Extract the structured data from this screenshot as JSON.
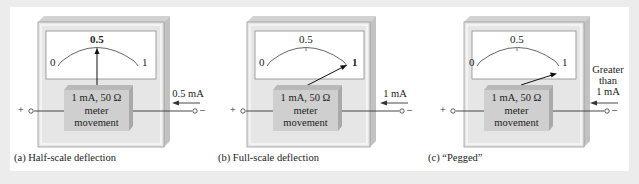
{
  "figures": [
    {
      "id": "a",
      "caption": "(a) Half-scale deflection",
      "scale": {
        "min_label": "0",
        "mid_label": "0.5",
        "max_label": "1",
        "mid_bold": true,
        "max_bold": false
      },
      "movement": {
        "line1": "1 mA, 50 Ω",
        "line2": "meter",
        "line3": "movement"
      },
      "terminals": {
        "plus": "+",
        "minus": "–"
      },
      "current_label": [
        "0.5 mA"
      ],
      "needle_position": "half-scale"
    },
    {
      "id": "b",
      "caption": "(b) Full-scale deflection",
      "scale": {
        "min_label": "0",
        "mid_label": "0.5",
        "max_label": "1",
        "mid_bold": false,
        "max_bold": true
      },
      "movement": {
        "line1": "1 mA, 50 Ω",
        "line2": "meter",
        "line3": "movement"
      },
      "terminals": {
        "plus": "+",
        "minus": "–"
      },
      "current_label": [
        "1 mA"
      ],
      "needle_position": "full-scale"
    },
    {
      "id": "c",
      "caption": "(c) “Pegged”",
      "scale": {
        "min_label": "0",
        "mid_label": "0.5",
        "max_label": "1",
        "mid_bold": false,
        "max_bold": false
      },
      "movement": {
        "line1": "1 mA, 50 Ω",
        "line2": "meter",
        "line3": "movement"
      },
      "terminals": {
        "plus": "+",
        "minus": "–"
      },
      "current_label": [
        "Greater",
        "than",
        "1 mA"
      ],
      "needle_position": "pegged"
    }
  ],
  "colors": {
    "background": "#ececec",
    "panel": "#ffffff",
    "bezel": "#e4e4e4",
    "bezel_top": "#cfcfcf",
    "bezel_side": "#c4c4c4",
    "face": "#ffffff",
    "movement_front": "#cdcdcd",
    "movement_top": "#b5b5b5",
    "ink": "#222222"
  }
}
